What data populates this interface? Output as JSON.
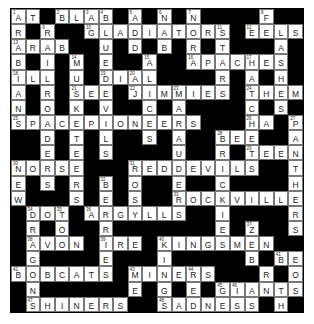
{
  "puzzle": {
    "rows": 20,
    "cols": 20,
    "grid": [
      "AT#BLAB#A#N#N####F#",
      "R#R##GLADIATORS#EELS",
      "ARAB##U#D#B#R#T###A#",
      "B#I#M#E##A##APACHES#",
      "ILL#U#DIAL####R#A#H#",
      "A#R#SEE#JIMMIES#THEM",
      "N#O#K#V##C#A####C#S#",
      "SPACEPIONEERS###HA#P",
      "##D#T#L##S#A##BEE##A",
      "##E#E#S####U##R#TEEN",
      "NORSE###REDDEVILS##T",
      "E#S#R#B#O##E##C####H",
      "W###S#E#S##ROCKVILLE",
      "#DOT#ARGYLLS##I####R",
      "#R#O##R#######E#Z##S",
      "#AVON#IRE#KINGSMEN##",
      "#G####E###I#####B#BE",
      "BOBCATS#MINERS###R#O#",
      "#N######E#G#E#GIANTS",
      "#SHINERS##SADNESS#H#"
    ],
    "numbers": {
      "0,0": "1",
      "0,3": "2",
      "0,5": "3",
      "0,6": "4",
      "0,8": "5",
      "0,10": "6",
      "0,12": "7",
      "0,17": "8",
      "1,2": "9",
      "1,5": "10",
      "1,14": "11",
      "1,16": "12",
      "2,0": "13",
      "3,4": "14",
      "3,9": "15",
      "3,12": "16",
      "3,16": "17",
      "4,0": "18",
      "4,6": "19",
      "4,8": "20",
      "5,4": "21",
      "5,8": "22",
      "5,11": "23",
      "5,16": "24",
      "7,0": "25",
      "7,16": "26",
      "7,19": "27",
      "8,14": "28",
      "9,16": "29",
      "10,0": "30",
      "10,8": "31",
      "11,6": "32",
      "12,11": "33",
      "13,1": "34",
      "13,3": "35",
      "13,5": "36",
      "14,16": "37",
      "15,1": "38",
      "15,6": "39",
      "15,10": "40",
      "16,18": "41",
      "17,0": "42",
      "17,8": "43",
      "17,12": "44",
      "18,14": "45",
      "18,15": "46",
      "19,1": "47",
      "19,10": "48"
    }
  }
}
